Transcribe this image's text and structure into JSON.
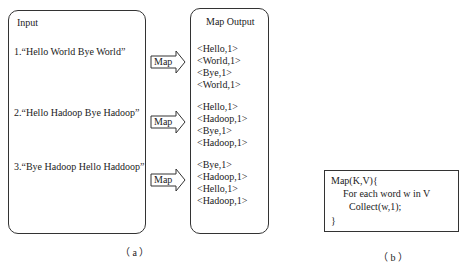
{
  "panel_a": {
    "input_box": {
      "title": "Input",
      "items": [
        "1.“Hello World Bye World”",
        "2.“Hello Hadoop Bye Hadoop”",
        "3.“Bye Hadoop Hello Haddoop”"
      ]
    },
    "arrows": [
      {
        "label": "Map"
      },
      {
        "label": "Map"
      },
      {
        "label": "Map"
      }
    ],
    "output_box": {
      "title": "Map Output",
      "groups": [
        [
          "<Hello,1>",
          "<World,1>",
          "<Bye,1>",
          "<World,1>"
        ],
        [
          "<Hello,1>",
          "<Hadoop,1>",
          "<Bye,1>",
          "<Hadoop,1>"
        ],
        [
          "<Bye,1>",
          "<Hadoop,1>",
          "<Hello,1>",
          "<Hadoop,1>"
        ]
      ]
    },
    "caption": "（ a ）"
  },
  "panel_b": {
    "code_lines": [
      "Map(K,V){",
      "For each word w in V",
      "Collect(w,1);",
      "}"
    ],
    "caption": "（ b ）"
  }
}
